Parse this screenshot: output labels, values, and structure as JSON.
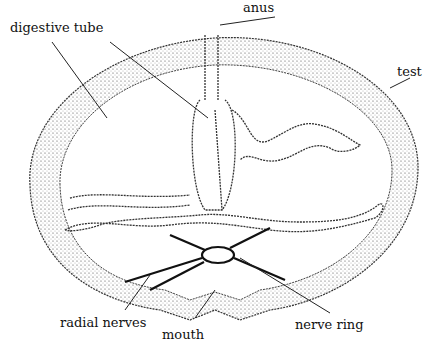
{
  "diagram": {
    "labels": {
      "anus": "anus",
      "digestive_tube": "digestive tube",
      "test": "test",
      "radial_nerves": "radial nerves",
      "mouth": "mouth",
      "nerve_ring": "nerve ring"
    },
    "colors": {
      "ink": "#111111",
      "stipple": "#555555",
      "background": "#ffffff"
    }
  }
}
